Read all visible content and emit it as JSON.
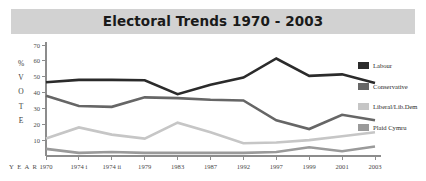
{
  "chart_data": {
    "type": "line",
    "title": "Electoral Trends 1970 - 2003",
    "xlabel": "YEAR",
    "ylabel": "% VOTE",
    "ylabel_chars": [
      "%",
      "V",
      "O",
      "T",
      "E"
    ],
    "grid": false,
    "legend_position": "right",
    "ylim": [
      0,
      70
    ],
    "yticks": [
      10,
      20,
      30,
      40,
      50,
      60,
      70
    ],
    "categories": [
      "1970",
      "1974 i",
      "1974 ii",
      "1979",
      "1983",
      "1987",
      "1992",
      "1997",
      "1999",
      "2001",
      "2003"
    ],
    "series": [
      {
        "name": "Labour",
        "color": "#2b2b2b",
        "values": [
          46.5,
          48,
          48,
          47.8,
          39,
          45,
          49.5,
          61.5,
          50.5,
          51.5,
          46
        ]
      },
      {
        "name": "Conservative",
        "color": "#666666",
        "values": [
          38,
          31.5,
          31,
          37,
          36.5,
          35.5,
          35,
          22.5,
          17,
          26,
          22.5
        ]
      },
      {
        "name": "Liberal/Lib.Dem",
        "color": "#c6c6c6",
        "values": [
          11,
          18,
          13.5,
          11,
          21,
          15,
          8,
          8.5,
          10,
          12.5,
          15
        ]
      },
      {
        "name": "Plaid Cymru",
        "color": "#9a9a9a",
        "values": [
          4.5,
          2,
          2.5,
          2,
          2,
          2,
          2,
          2.5,
          5.5,
          3,
          6
        ]
      }
    ]
  },
  "legend": {
    "items": [
      {
        "label": "Labour",
        "color": "#2b2b2b"
      },
      {
        "label": "Conservative",
        "color": "#666666"
      },
      {
        "label": "Liberal/Lib.Dem",
        "color": "#c6c6c6"
      },
      {
        "label": "Plaid Cymru",
        "color": "#9a9a9a"
      }
    ]
  },
  "axes": {
    "y_caption": "% V O T E",
    "x_caption": "Y E A R"
  }
}
